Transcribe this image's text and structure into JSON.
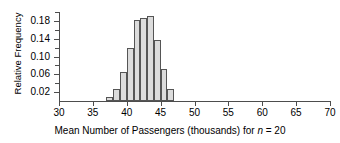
{
  "chart_data": {
    "type": "bar",
    "title": "",
    "xlabel_prefix": "Mean Number of Passengers (thousands) for ",
    "xlabel_var": "n",
    "xlabel_suffix": " = 20",
    "xlabel_full": "Mean Number of Passengers (thousands) for n = 20",
    "ylabel": "Relative Frequency",
    "xlim": [
      30,
      70
    ],
    "ylim": [
      0,
      0.2
    ],
    "grid": false,
    "legend": "none",
    "bin_width": 1,
    "x_major_ticks": [
      30,
      35,
      40,
      45,
      50,
      55,
      60,
      65,
      70
    ],
    "x_tick_labels": [
      "30",
      "35",
      "40",
      "45",
      "50",
      "55",
      "60",
      "65",
      "70"
    ],
    "y_major_ticks": [
      0.02,
      0.06,
      0.1,
      0.14,
      0.18
    ],
    "y_tick_labels": [
      "0.02",
      "0.06",
      "0.10",
      "0.14",
      "0.18"
    ],
    "y_minor_ticks": [
      0.04,
      0.08,
      0.12,
      0.16,
      0.2
    ],
    "bins": [
      {
        "left": 37,
        "right": 38,
        "value": 0.008
      },
      {
        "left": 38,
        "right": 39,
        "value": 0.026
      },
      {
        "left": 39,
        "right": 40,
        "value": 0.066
      },
      {
        "left": 40,
        "right": 41,
        "value": 0.12
      },
      {
        "left": 41,
        "right": 42,
        "value": 0.183
      },
      {
        "left": 42,
        "right": 43,
        "value": 0.187
      },
      {
        "left": 43,
        "right": 44,
        "value": 0.19
      },
      {
        "left": 44,
        "right": 45,
        "value": 0.137
      },
      {
        "left": 45,
        "right": 46,
        "value": 0.073
      },
      {
        "left": 46,
        "right": 47,
        "value": 0.026
      }
    ],
    "categories": [
      37,
      38,
      39,
      40,
      41,
      42,
      43,
      44,
      45,
      46
    ],
    "values": [
      0.008,
      0.026,
      0.066,
      0.12,
      0.183,
      0.187,
      0.19,
      0.137,
      0.073,
      0.026
    ],
    "colors": {
      "bar_fill": "#dcdcdc",
      "bar_border": "#555555",
      "axis": "#4d4d4d",
      "text": "#000000",
      "background": "#ffffff"
    }
  }
}
